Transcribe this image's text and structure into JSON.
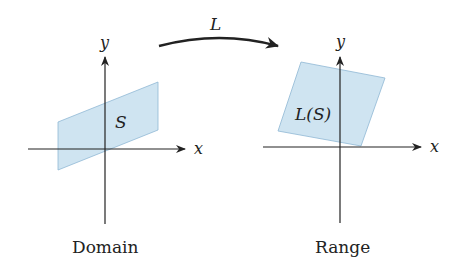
{
  "diagram": {
    "transform_label": "L",
    "domain": {
      "caption": "Domain",
      "x_label": "x",
      "y_label": "y",
      "region_label": "S"
    },
    "range": {
      "caption": "Range",
      "x_label": "x",
      "y_label": "y",
      "region_label": "L(S)"
    },
    "colors": {
      "region_fill": "#cfe4f1",
      "region_stroke": "#8fb8d4",
      "axis": "#222222"
    }
  }
}
